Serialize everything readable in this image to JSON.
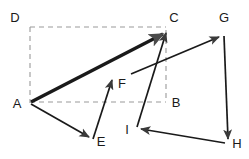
{
  "figure": {
    "width": 249,
    "height": 159,
    "background": "#ffffff",
    "stroke_color": "#1a1a1a",
    "dashed_color": "#9a9a9a",
    "label_color": "#1a1a1a"
  },
  "points": {
    "A": {
      "label": "A",
      "x": 30,
      "y": 103,
      "label_x": 17,
      "label_y": 105
    },
    "B": {
      "label": "B",
      "x": 166,
      "y": 102,
      "label_x": 174,
      "label_y": 104
    },
    "C": {
      "label": "C",
      "x": 167,
      "y": 29,
      "label_x": 174,
      "label_y": 19
    },
    "D": {
      "label": "D",
      "x": 30,
      "y": 27,
      "label_x": 15,
      "label_y": 19
    },
    "E": {
      "label": "E",
      "x": 92,
      "y": 141,
      "label_x": 98,
      "label_y": 143
    },
    "F": {
      "label": "F",
      "x": 112,
      "y": 76,
      "label_x": 119,
      "label_y": 85
    },
    "G": {
      "label": "G",
      "x": 222,
      "y": 35,
      "label_x": 222,
      "label_y": 19
    },
    "H": {
      "label": "H",
      "x": 228,
      "y": 143,
      "label_x": 235,
      "label_y": 145
    },
    "I": {
      "label": "I",
      "x": 137,
      "y": 128,
      "label_x": 127,
      "label_y": 130
    }
  },
  "vectors": [
    {
      "name": "A-to-C-resultant",
      "from": "A",
      "to": "C",
      "style": "thick-solid-arrow",
      "width": 3.4
    },
    {
      "name": "A-to-E",
      "from": "A",
      "to": "E",
      "style": "solid-arrow",
      "width": 1.7
    },
    {
      "name": "E-to-F",
      "from": "E",
      "to": "F",
      "style": "solid-arrow",
      "width": 1.7
    },
    {
      "name": "I-to-C",
      "from": "I",
      "to": "C",
      "style": "solid-arrow",
      "width": 1.7
    },
    {
      "name": "I-to-G",
      "from": "I",
      "to": "G",
      "style": "solid-arrow",
      "width": 1.7
    },
    {
      "name": "G-to-H",
      "from": "G",
      "to": "H",
      "style": "solid-arrow",
      "width": 1.7
    },
    {
      "name": "H-to-I",
      "from": "H",
      "to": "I",
      "style": "solid-arrow",
      "width": 1.7
    }
  ],
  "construction_lines": [
    {
      "name": "dashed-D-to-C",
      "from": "D",
      "to": "C",
      "style": "dashed"
    },
    {
      "name": "dashed-D-to-A",
      "from": "D",
      "to": "A",
      "style": "dashed"
    },
    {
      "name": "dashed-A-to-B",
      "from": "A",
      "to": "B",
      "style": "dashed"
    },
    {
      "name": "dashed-C-to-B",
      "from": "C",
      "to": "B",
      "style": "dashed"
    }
  ]
}
